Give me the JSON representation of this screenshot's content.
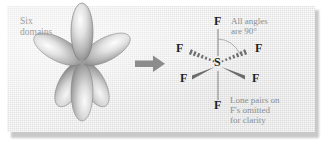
{
  "figure": {
    "kind": "chemistry-diagram",
    "background_color": "#e8e8e8",
    "panel_border_color": "#c9c9c9"
  },
  "left_panel": {
    "caption_line_1": "Six",
    "caption_line_2": "domains",
    "caption_color": "#9b9ea0",
    "orbital": {
      "lobe_count": 6,
      "lobe_fill_light": "#f2f2f2",
      "lobe_fill_dark": "#8e8e8e",
      "lobe_outline": "#7a7a7a",
      "arrangement": "octahedral",
      "lobe_angles_deg": [
        90,
        270,
        150,
        210,
        30,
        330
      ]
    }
  },
  "arrow": {
    "name": "rightwards-arrow",
    "color": "#8c8c8c",
    "direction": "right"
  },
  "right_panel": {
    "central_atom": "S",
    "atom_color": "#1e1e1e",
    "bond_color": "#7d7d7d",
    "ligands": [
      {
        "label": "F",
        "position": "top",
        "bond": "line"
      },
      {
        "label": "F",
        "position": "bottom",
        "bond": "line"
      },
      {
        "label": "F",
        "position": "upper-left",
        "bond": "dashed-wedge"
      },
      {
        "label": "F",
        "position": "upper-right",
        "bond": "dashed-wedge"
      },
      {
        "label": "F",
        "position": "lower-left",
        "bond": "solid-wedge"
      },
      {
        "label": "F",
        "position": "lower-right",
        "bond": "solid-wedge"
      }
    ],
    "angle_note_line_1": "All angles",
    "angle_note_line_2": "are 90°",
    "angle_value": "90°",
    "lone_pair_note_line_1": "Lone pairs on",
    "lone_pair_note_line_2": "F's omitted",
    "lone_pair_note_line_3": "for clarity",
    "note_color": "#8a8f93"
  }
}
